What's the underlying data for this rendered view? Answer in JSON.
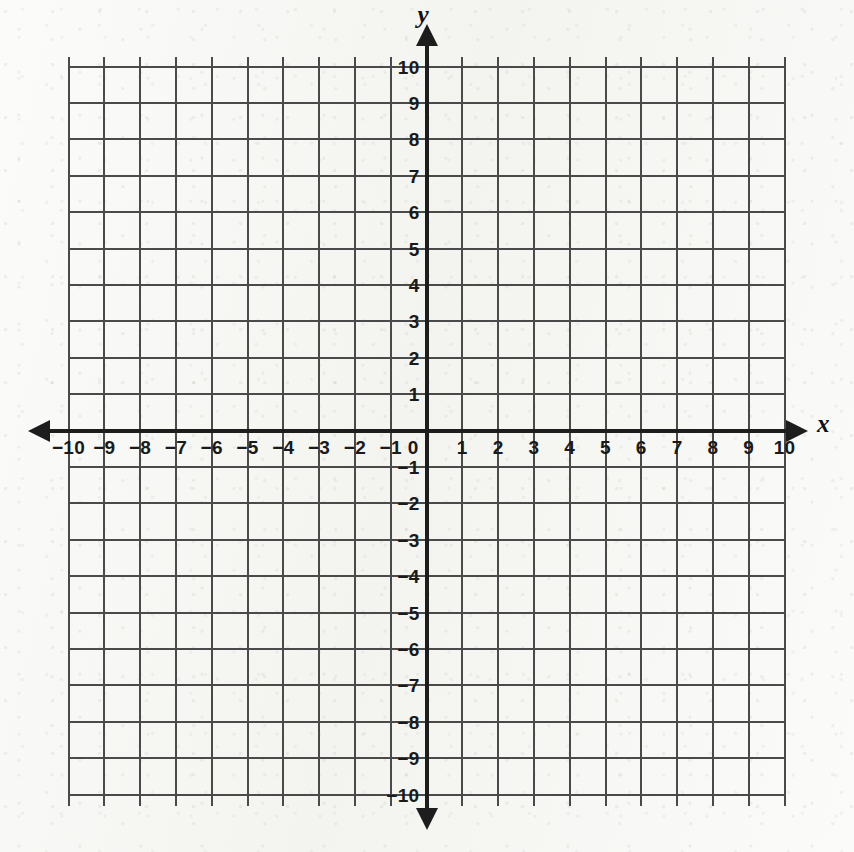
{
  "figure": {
    "background_color": "#f7f7f4",
    "grid_color": "#4a4a4a",
    "axis_color": "#1d1d1d",
    "label_color": "#1a1a1a"
  },
  "axis_names": {
    "x": "x",
    "y": "y"
  },
  "chart_data": {
    "type": "scatter",
    "title": "",
    "subtitle": "",
    "xlabel": "x",
    "ylabel": "y",
    "xlim": [
      -10,
      10
    ],
    "ylim": [
      -10,
      10
    ],
    "grid": true,
    "grid_step": 1,
    "legend": null,
    "series": [],
    "x": [],
    "y": [],
    "annotations": [],
    "xticks": [
      -10,
      -9,
      -8,
      -7,
      -6,
      -5,
      -4,
      -3,
      -2,
      -1,
      0,
      1,
      2,
      3,
      4,
      5,
      6,
      7,
      8,
      9,
      10
    ],
    "yticks": [
      -10,
      -9,
      -8,
      -7,
      -6,
      -5,
      -4,
      -3,
      -2,
      -1,
      1,
      2,
      3,
      4,
      5,
      6,
      7,
      8,
      9,
      10
    ],
    "xtick_labels": [
      "−10",
      "−9",
      "−8",
      "−7",
      "−6",
      "−5",
      "−4",
      "−3",
      "−2",
      "−1",
      "0",
      "1",
      "2",
      "3",
      "4",
      "5",
      "6",
      "7",
      "8",
      "9",
      "10"
    ],
    "ytick_labels": [
      "−10",
      "−9",
      "−8",
      "−7",
      "−6",
      "−5",
      "−4",
      "−3",
      "−2",
      "−1",
      "1",
      "2",
      "3",
      "4",
      "5",
      "6",
      "7",
      "8",
      "9",
      "10"
    ],
    "origin_label": "0",
    "arrows": [
      "left",
      "right",
      "up",
      "down"
    ]
  }
}
